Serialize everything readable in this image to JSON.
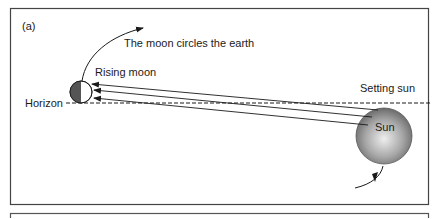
{
  "figure": {
    "panel_label": "(a)",
    "labels": {
      "moon_circles": "The moon circles the earth",
      "rising_moon": "Rising moon",
      "horizon": "Horizon",
      "setting_sun": "Setting sun",
      "sun": "Sun"
    },
    "colors": {
      "frame": "#444444",
      "moon_dark": "#555555",
      "sun_light": "#e8e8e8",
      "sun_dark": "#6a6a6a",
      "line": "#1a1a1a"
    }
  }
}
